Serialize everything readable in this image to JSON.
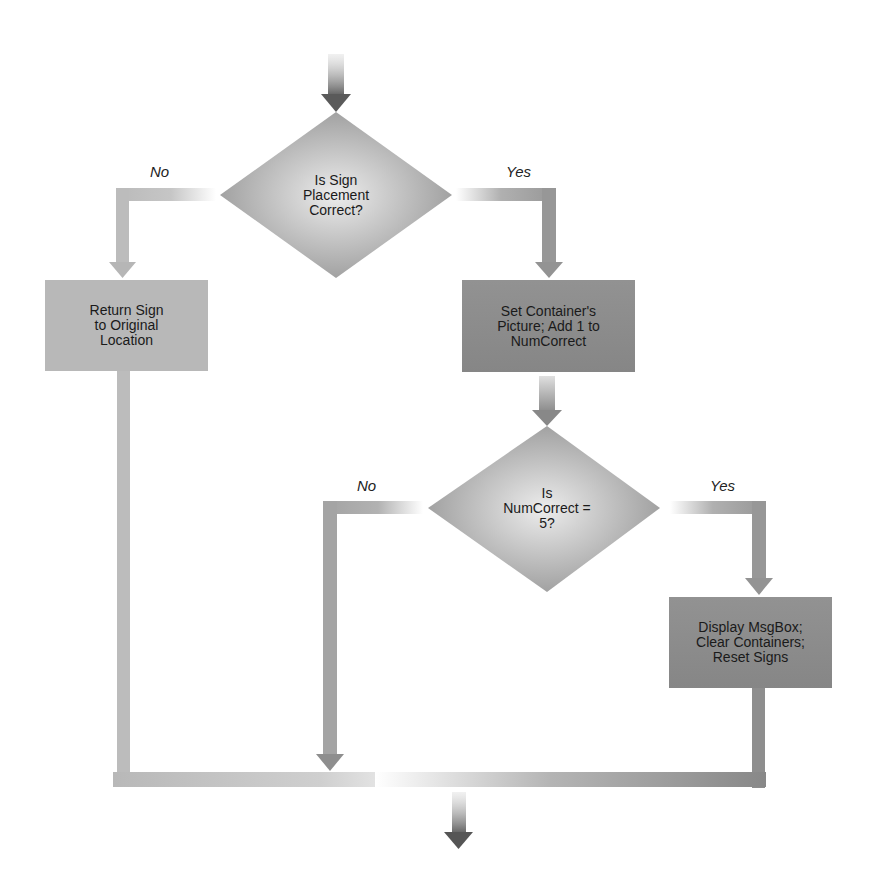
{
  "diagram": {
    "type": "flowchart",
    "nodes": {
      "decision_sign": {
        "shape": "diamond",
        "text": "Is Sign\nPlacement\nCorrect?"
      },
      "process_return": {
        "shape": "rect",
        "text": "Return Sign\nto Original\nLocation"
      },
      "process_set": {
        "shape": "rect",
        "text": "Set Container's\nPicture; Add 1 to\nNumCorrect"
      },
      "decision_num": {
        "shape": "diamond",
        "text": "Is\nNumCorrect =\n5?"
      },
      "process_display": {
        "shape": "rect",
        "text": "Display MsgBox;\nClear Containers;\nReset Signs"
      }
    },
    "edge_labels": {
      "sign_no": "No",
      "sign_yes": "Yes",
      "num_no": "No",
      "num_yes": "Yes"
    },
    "edges": [
      {
        "from": "start",
        "to": "decision_sign"
      },
      {
        "from": "decision_sign",
        "to": "process_return",
        "label": "No"
      },
      {
        "from": "decision_sign",
        "to": "process_set",
        "label": "Yes"
      },
      {
        "from": "process_set",
        "to": "decision_num"
      },
      {
        "from": "decision_num",
        "to": "merge",
        "label": "No"
      },
      {
        "from": "decision_num",
        "to": "process_display",
        "label": "Yes"
      },
      {
        "from": "process_return",
        "to": "merge"
      },
      {
        "from": "process_display",
        "to": "merge"
      },
      {
        "from": "merge",
        "to": "end"
      }
    ],
    "colors": {
      "light_box": "#b8b8b8",
      "dark_box": "#8a8a8a",
      "diamond_center": "#e6e6e6",
      "diamond_edge": "#9a9a9a",
      "arrow_dark": "#5a5a5a",
      "connector_light": "#bdbdbd",
      "connector_mid": "#9c9c9c"
    }
  }
}
